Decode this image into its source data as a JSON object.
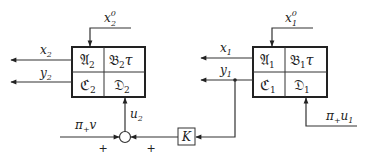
{
  "diagram": {
    "block2": {
      "A": "𝔄",
      "A_sub": "2",
      "B": "𝔅",
      "B_sub": "2",
      "B_suffix": "τ",
      "C": "ℭ",
      "C_sub": "2",
      "D": "𝔇",
      "D_sub": "2"
    },
    "block1": {
      "A": "𝔄",
      "A_sub": "1",
      "B": "𝔅",
      "B_sub": "1",
      "B_suffix": "τ",
      "C": "ℭ",
      "C_sub": "1",
      "D": "𝔇",
      "D_sub": "1"
    },
    "signals": {
      "x2_0": {
        "base": "x",
        "sub": "2",
        "sup": "0"
      },
      "x1_0": {
        "base": "x",
        "sub": "1",
        "sup": "0"
      },
      "x2": {
        "base": "x",
        "sub": "2"
      },
      "y2": {
        "base": "y",
        "sub": "2"
      },
      "x1": {
        "base": "x",
        "sub": "1"
      },
      "y1": {
        "base": "y",
        "sub": "1"
      },
      "u2": {
        "base": "u",
        "sub": "2"
      },
      "pi_v": {
        "base": "π",
        "sub": "+",
        "tail": "v"
      },
      "pi_u1": {
        "base": "π",
        "sub": "+",
        "tail": "u",
        "tail_sub": "1"
      }
    },
    "gain": "K",
    "sum_signs": [
      "+",
      "+"
    ]
  }
}
